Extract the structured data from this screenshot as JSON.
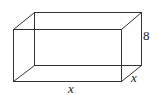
{
  "figure": {
    "type": "rectangular-prism",
    "stroke_color": "#333333",
    "labels": {
      "height": "8",
      "length": "x",
      "depth": "x"
    },
    "vertices": {
      "front_top_left": [
        13,
        29
      ],
      "front_top_right": [
        121,
        29
      ],
      "front_bottom_left": [
        13,
        81
      ],
      "front_bottom_right": [
        121,
        81
      ],
      "back_top_left": [
        34,
        12
      ],
      "back_top_right": [
        141,
        12
      ],
      "back_bottom_left": [
        34,
        65
      ],
      "back_bottom_right": [
        141,
        65
      ]
    }
  }
}
